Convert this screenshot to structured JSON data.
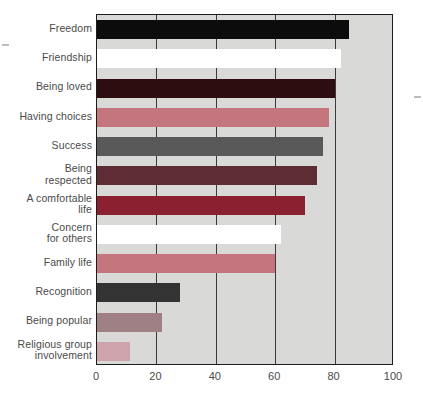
{
  "chart_data": {
    "type": "bar",
    "orientation": "horizontal",
    "title": "",
    "subtitle": "",
    "xlabel": "",
    "ylabel": "",
    "xlim": [
      0,
      100
    ],
    "grid": true,
    "legend": "none",
    "xticks": [
      0,
      20,
      40,
      60,
      80,
      100
    ],
    "xtick_labels": [
      "0",
      "20",
      "40",
      "60",
      "80",
      "100"
    ],
    "categories": [
      "Freedom",
      "Friendship",
      "Being loved",
      "Having choices",
      "Success",
      "Being respected",
      "A comfortable life",
      "Concern for others",
      "Family life",
      "Recognition",
      "Being popular",
      "Religious group involvement"
    ],
    "values": [
      85,
      82,
      80,
      78,
      76,
      74,
      70,
      62,
      60,
      28,
      22,
      11
    ],
    "bar_colors": [
      "#0c0c0c",
      "#ffffff",
      "#2d0d10",
      "#c4757e",
      "#595959",
      "#5e2c33",
      "#8b2030",
      "#ffffff",
      "#c4757e",
      "#333333",
      "#9e8085",
      "#cfa3ab"
    ]
  },
  "style": {
    "plot_background": "#d9dad7",
    "page_background": "#ffffff",
    "axis_color": "#1c1c1c",
    "gridline_color": "#3a3a3a",
    "label_color": "#4a4a4a"
  }
}
